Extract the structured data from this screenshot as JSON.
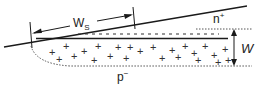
{
  "diagram": {
    "type": "semiconductor-junction-cross-section",
    "labels": {
      "ws_main": "W",
      "ws_sub": "S",
      "w": "W",
      "n_plus_base": "n",
      "n_plus_sup": "+",
      "p_minus_base": "p",
      "p_minus_sup": "−"
    },
    "regions": [
      {
        "name": "n+ layer",
        "label": "n+"
      },
      {
        "name": "depletion region (positive charges)",
        "label": "+"
      },
      {
        "name": "p- substrate",
        "label": "p−"
      }
    ],
    "dimensions": [
      {
        "name": "Ws",
        "description": "lateral width along sloped surface"
      },
      {
        "name": "W",
        "description": "depletion depth"
      }
    ],
    "plus_glyph": "+",
    "plus_positions": [
      [
        52,
        52
      ],
      [
        66,
        46
      ],
      [
        84,
        51
      ],
      [
        98,
        46
      ],
      [
        59,
        59
      ],
      [
        74,
        56
      ],
      [
        94,
        60
      ],
      [
        110,
        56
      ],
      [
        118,
        47
      ],
      [
        126,
        58
      ],
      [
        130,
        47
      ],
      [
        140,
        51
      ],
      [
        153,
        47
      ],
      [
        162,
        58
      ],
      [
        172,
        50
      ],
      [
        178,
        57
      ],
      [
        185,
        46
      ],
      [
        194,
        53
      ],
      [
        198,
        60
      ],
      [
        205,
        46
      ],
      [
        214,
        55
      ],
      [
        218,
        62
      ],
      [
        225,
        49
      ],
      [
        228,
        60
      ]
    ],
    "colors": {
      "line": "#1a1a1a",
      "dotted": "#555555",
      "text": "#222222",
      "background": "#ffffff"
    }
  }
}
